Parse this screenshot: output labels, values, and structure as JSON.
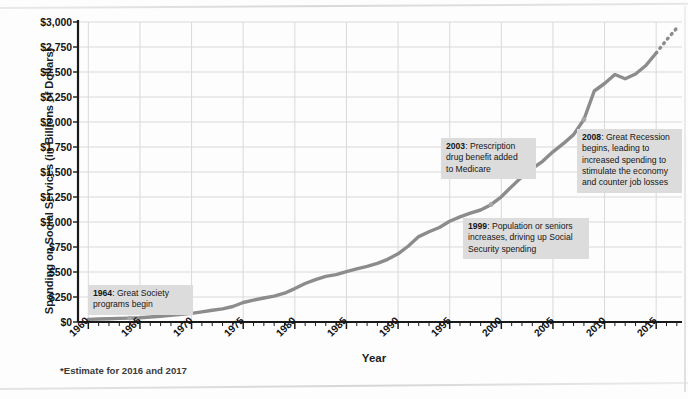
{
  "chart_data": {
    "type": "line",
    "title": "",
    "xlabel": "Year",
    "ylabel": "Spending on Social Services (in Billions of Dollars)",
    "xlim": [
      1959,
      2017.5
    ],
    "ylim": [
      0,
      3000
    ],
    "grid": true,
    "legend": false,
    "footnote": "*Estimate for 2016 and 2017",
    "y_ticks": [
      "$0",
      "$250",
      "$500",
      "$750",
      "$1,000",
      "$1,250",
      "$1,500",
      "$1,750",
      "$2,000",
      "$2,250",
      "$2,500",
      "$2,750",
      "$3,000"
    ],
    "y_tick_values": [
      0,
      250,
      500,
      750,
      1000,
      1250,
      1500,
      1750,
      2000,
      2250,
      2500,
      2750,
      3000
    ],
    "x_ticks": [
      "1960",
      "1965",
      "1970",
      "1975",
      "1980",
      "1985",
      "1990",
      "1995",
      "2000",
      "2005",
      "2010",
      "2015"
    ],
    "x_tick_values": [
      1960,
      1965,
      1970,
      1975,
      1980,
      1985,
      1990,
      1995,
      2000,
      2005,
      2010,
      2015
    ],
    "x_minor_step": 1,
    "line_color": "#8c8c8c",
    "series": [
      {
        "name": "Spending on Social Services",
        "x": [
          1960,
          1961,
          1962,
          1963,
          1964,
          1965,
          1966,
          1967,
          1968,
          1969,
          1970,
          1971,
          1972,
          1973,
          1974,
          1975,
          1976,
          1977,
          1978,
          1979,
          1980,
          1981,
          1982,
          1983,
          1984,
          1985,
          1986,
          1987,
          1988,
          1989,
          1990,
          1991,
          1992,
          1993,
          1994,
          1995,
          1996,
          1997,
          1998,
          1999,
          2000,
          2001,
          2002,
          2003,
          2004,
          2005,
          2006,
          2007,
          2008,
          2009,
          2010,
          2011,
          2012,
          2013,
          2014,
          2015,
          2016,
          2017
        ],
        "y": [
          26,
          30,
          33,
          36,
          39,
          43,
          50,
          58,
          68,
          76,
          86,
          101,
          117,
          131,
          155,
          195,
          219,
          240,
          259,
          288,
          334,
          385,
          424,
          456,
          474,
          504,
          532,
          557,
          587,
          627,
          682,
          760,
          854,
          902,
          945,
          1007,
          1051,
          1089,
          1120,
          1173,
          1252,
          1354,
          1452,
          1535,
          1607,
          1702,
          1783,
          1874,
          2025,
          2310,
          2385,
          2475,
          2432,
          2480,
          2565,
          2690,
          2820,
          2940
        ],
        "estimate_from": 2015
      }
    ],
    "markers": [
      {
        "x": 1964,
        "y": 39
      },
      {
        "x": 1999,
        "y": 1173
      },
      {
        "x": 2003,
        "y": 1535
      },
      {
        "x": 2008,
        "y": 2025
      }
    ],
    "annotations": [
      {
        "id": "annot-1964",
        "year": "1964",
        "text": ": Great Society programs begin",
        "lines": [
          "1964: Great Society",
          "programs begin"
        ]
      },
      {
        "id": "annot-2003",
        "year": "2003",
        "text": ": Prescription drug benefit added to Medicare",
        "lines": [
          "2003: Prescription",
          "drug benefit added",
          "to Medicare"
        ]
      },
      {
        "id": "annot-1999",
        "year": "1999",
        "text": ": Population or seniors increases, driving up Social Security spending",
        "lines": [
          "1999: Population or seniors",
          "increases, driving up Social",
          "Security spending"
        ]
      },
      {
        "id": "annot-2008",
        "year": "2008",
        "text": ": Great Recession begins, leading to increased spending to stimulate the economy and counter job losses",
        "lines": [
          "2008: Great Recession",
          "begins, leading to",
          "increased spending to",
          "stimulate the economy",
          "and counter job losses"
        ]
      }
    ]
  },
  "axis": {
    "x_title": "Year",
    "y_title": "Spending on Social Services (in Billions of Dollars)"
  },
  "footnote": {
    "text": "*Estimate for 2016 and 2017"
  },
  "annotation_text": {
    "a1964_year": "1964",
    "a1964_rest": ": Great Society",
    "a1964_l2": "programs begin",
    "a2003_year": "2003",
    "a2003_rest": ": Prescription",
    "a2003_l2": "drug benefit added",
    "a2003_l3": "to Medicare",
    "a1999_year": "1999",
    "a1999_rest": ": Population or seniors",
    "a1999_l2": "increases, driving up Social",
    "a1999_l3": "Security spending",
    "a2008_year": "2008",
    "a2008_rest": ": Great Recession",
    "a2008_l2": "begins, leading to",
    "a2008_l3": "increased spending to",
    "a2008_l4": "stimulate the economy",
    "a2008_l5": "and counter job losses"
  },
  "colors": {
    "line": "#8c8c8c",
    "grid": "#d9d9d9",
    "axis": "#1a1a1a",
    "annotation_bg": "#dcdcdc",
    "page_bg": "#fdfdfd"
  }
}
